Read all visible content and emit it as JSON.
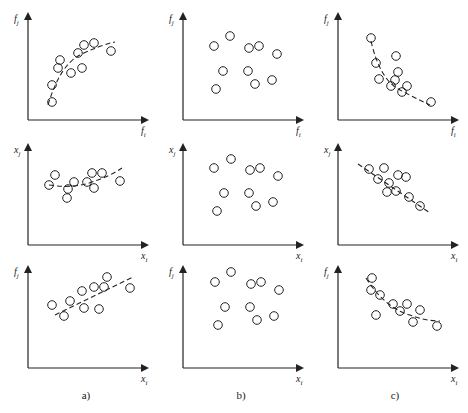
{
  "figure": {
    "captions": [
      "a)",
      "b)",
      "c)"
    ],
    "columns_x": [
      28,
      183,
      338
    ],
    "rows": [
      {
        "top": 12,
        "axis_y": 120
      },
      {
        "top": 143,
        "axis_y": 245
      },
      {
        "top": 265,
        "axis_y": 368
      }
    ],
    "axis_length_x": 117,
    "colors": {
      "stroke": "#222222",
      "background": "#ffffff"
    }
  },
  "chart_data": [
    {
      "type": "scatter",
      "panel": "a1",
      "xlabel": "f_i",
      "ylabel": "f_j",
      "trend": "increasing concave",
      "points": [
        [
          52,
          102
        ],
        [
          52,
          85
        ],
        [
          58,
          68
        ],
        [
          60,
          60
        ],
        [
          71,
          73
        ],
        [
          78,
          53
        ],
        [
          82,
          68
        ],
        [
          84,
          45
        ],
        [
          94,
          43
        ],
        [
          111,
          51
        ]
      ],
      "fit": "M48,105 Q60,65 80,55 Q100,45 115,42"
    },
    {
      "type": "scatter",
      "panel": "b1",
      "xlabel": "f_i",
      "ylabel": "f_j",
      "trend": "none",
      "points": [
        [
          75,
          36
        ],
        [
          59,
          46
        ],
        [
          94,
          48
        ],
        [
          104,
          46
        ],
        [
          122,
          54
        ],
        [
          68,
          71
        ],
        [
          93,
          71
        ],
        [
          100,
          84
        ],
        [
          117,
          80
        ],
        [
          61,
          89
        ]
      ]
    },
    {
      "type": "scatter",
      "panel": "c1",
      "xlabel": "f_i",
      "ylabel": "f_j",
      "trend": "decreasing convex",
      "points": [
        [
          61,
          38
        ],
        [
          66,
          63
        ],
        [
          86,
          56
        ],
        [
          88,
          72
        ],
        [
          85,
          80
        ],
        [
          69,
          79
        ],
        [
          81,
          86
        ],
        [
          92,
          92
        ],
        [
          97,
          86
        ],
        [
          121,
          102
        ]
      ],
      "fit": "M61,41 Q70,80 90,90 Q105,98 120,105"
    },
    {
      "type": "scatter",
      "panel": "a2",
      "xlabel": "x_i",
      "ylabel": "x_j",
      "trend": "weak positive",
      "points": [
        [
          49,
          54
        ],
        [
          55,
          44
        ],
        [
          68,
          58
        ],
        [
          74,
          51
        ],
        [
          67,
          67
        ],
        [
          87,
          51
        ],
        [
          92,
          42
        ],
        [
          94,
          57
        ],
        [
          102,
          42
        ],
        [
          120,
          50
        ]
      ],
      "fit": "M49,54 Q75,58 95,50 Q110,45 122,37"
    },
    {
      "type": "scatter",
      "panel": "b2",
      "xlabel": "x_i",
      "ylabel": "x_j",
      "trend": "none",
      "points": [
        [
          76,
          28
        ],
        [
          59,
          37
        ],
        [
          95,
          39
        ],
        [
          105,
          37
        ],
        [
          123,
          45
        ],
        [
          69,
          62
        ],
        [
          94,
          62
        ],
        [
          101,
          75
        ],
        [
          118,
          71
        ],
        [
          62,
          80
        ]
      ]
    },
    {
      "type": "scatter",
      "panel": "c2",
      "xlabel": "x_i",
      "ylabel": "x_j",
      "trend": "negative linear",
      "points": [
        [
          59,
          38
        ],
        [
          74,
          37
        ],
        [
          68,
          48
        ],
        [
          79,
          52
        ],
        [
          88,
          44
        ],
        [
          96,
          46
        ],
        [
          77,
          61
        ],
        [
          86,
          60
        ],
        [
          99,
          66
        ],
        [
          110,
          75
        ]
      ],
      "fit": "M48,33 L120,82"
    },
    {
      "type": "scatter",
      "panel": "a3",
      "xlabel": "x_i",
      "ylabel": "f_j",
      "trend": "positive linear",
      "points": [
        [
          52,
          52
        ],
        [
          64,
          63
        ],
        [
          70,
          48
        ],
        [
          82,
          38
        ],
        [
          84,
          55
        ],
        [
          94,
          34
        ],
        [
          104,
          34
        ],
        [
          107,
          24
        ],
        [
          99,
          56
        ],
        [
          130,
          35
        ]
      ],
      "fit": "M55,62 L133,24"
    },
    {
      "type": "scatter",
      "panel": "b3",
      "xlabel": "x_i",
      "ylabel": "f_j",
      "trend": "none",
      "points": [
        [
          76,
          19
        ],
        [
          60,
          29
        ],
        [
          96,
          31
        ],
        [
          106,
          29
        ],
        [
          124,
          37
        ],
        [
          70,
          54
        ],
        [
          95,
          54
        ],
        [
          102,
          67
        ],
        [
          119,
          63
        ],
        [
          63,
          72
        ]
      ]
    },
    {
      "type": "scatter",
      "panel": "c3",
      "xlabel": "x_i",
      "ylabel": "f_j",
      "trend": "decreasing convex",
      "points": [
        [
          62,
          25
        ],
        [
          61,
          37
        ],
        [
          70,
          42
        ],
        [
          83,
          51
        ],
        [
          66,
          62
        ],
        [
          90,
          58
        ],
        [
          97,
          51
        ],
        [
          103,
          69
        ],
        [
          110,
          57
        ],
        [
          127,
          73
        ]
      ],
      "fit": "M56,25 Q75,55 100,62 Q115,68 130,68"
    }
  ]
}
